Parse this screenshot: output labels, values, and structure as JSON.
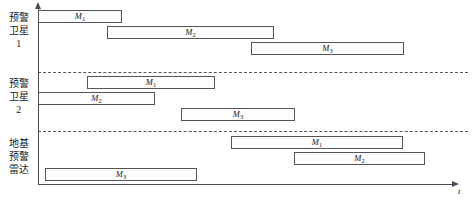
{
  "chart_data": {
    "type": "bar",
    "title": "",
    "subtitle": "",
    "xlabel": "t",
    "ylabel": "",
    "orientation": "horizontal-gantt",
    "grid": false,
    "legend": "none",
    "axis": {
      "x_label": "t",
      "x_arrow": true,
      "y_arrow": true,
      "x_range_px": [
        38,
        455
      ],
      "y_range_px": [
        8,
        184
      ]
    },
    "groups": [
      {
        "id": "sensor-1",
        "label_lines": [
          "预警",
          "卫星",
          "1"
        ],
        "label_text": "预警卫星 1",
        "bars": [
          {
            "target": "M1",
            "label": "M",
            "sub": "1",
            "start": 38,
            "end": 122,
            "row": 0
          },
          {
            "target": "M2",
            "label": "M",
            "sub": "2",
            "start": 107,
            "end": 274,
            "row": 1
          },
          {
            "target": "M3",
            "label": "M",
            "sub": "3",
            "start": 251,
            "end": 404,
            "row": 2
          }
        ]
      },
      {
        "id": "sensor-2",
        "label_lines": [
          "预警",
          "卫星",
          "2"
        ],
        "label_text": "预警卫星 2",
        "bars": [
          {
            "target": "M1",
            "label": "M",
            "sub": "1",
            "start": 87,
            "end": 215,
            "row": 0
          },
          {
            "target": "M2",
            "label": "M",
            "sub": "2",
            "start": 38,
            "end": 155,
            "row": 1
          },
          {
            "target": "M3",
            "label": "M",
            "sub": "3",
            "start": 181,
            "end": 295,
            "row": 2
          }
        ]
      },
      {
        "id": "sensor-3",
        "label_lines": [
          "地基",
          "预警",
          "雷达"
        ],
        "label_text": "地基预警雷达",
        "bars": [
          {
            "target": "M1",
            "label": "M",
            "sub": "1",
            "start": 231,
            "end": 403,
            "row": 0
          },
          {
            "target": "M2",
            "label": "M",
            "sub": "2",
            "start": 294,
            "end": 425,
            "row": 1
          },
          {
            "target": "M3",
            "label": "M",
            "sub": "3",
            "start": 45,
            "end": 197,
            "row": 2
          }
        ]
      }
    ],
    "dividers_y": [
      72,
      131
    ],
    "colors": {
      "axis": "#4c4c4c",
      "bar_stroke": "#545454",
      "bar_fill": "#fdfdfd",
      "divider": "#555555",
      "text": "#1a1a1a"
    }
  }
}
